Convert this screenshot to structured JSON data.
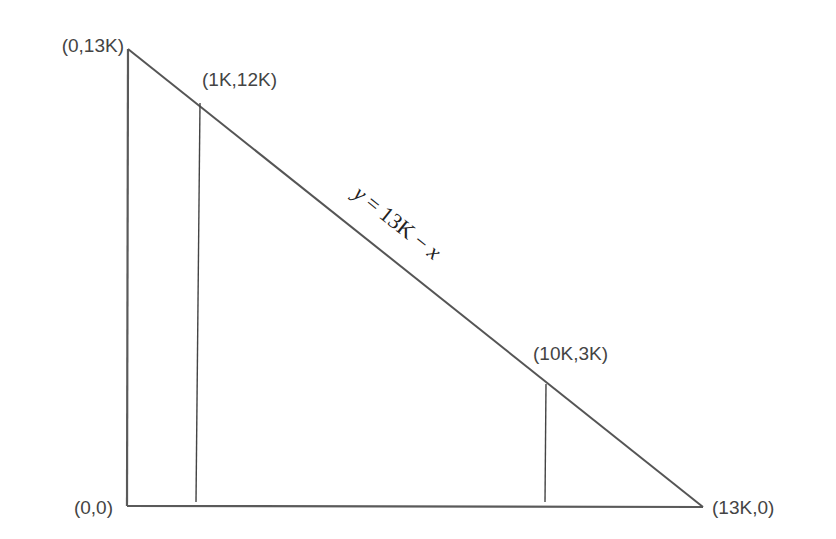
{
  "diagram": {
    "type": "triangle-region",
    "vertices": {
      "origin": "(0,0)",
      "top": "(0,13K)",
      "right": "(13K,0)"
    },
    "points": {
      "p1": "(1K,12K)",
      "p2": "(10K,3K)"
    },
    "hypotenuse_equation": {
      "y": "y",
      "eq": " = 13K − ",
      "x": "x"
    },
    "colors": {
      "line": "#555555",
      "text": "#444444"
    }
  }
}
